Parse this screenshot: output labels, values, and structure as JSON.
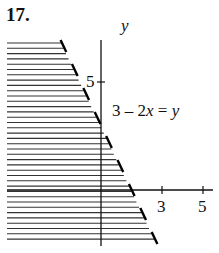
{
  "problem_number": "17.",
  "graph": {
    "y_axis_label": "y",
    "equation": "3 – 2x = y",
    "equation_parts": {
      "a": "3 – 2",
      "x": "x",
      "eq": " = ",
      "y": "y"
    },
    "x_ticks": [
      {
        "value": 3,
        "label": "3"
      },
      {
        "value": 5,
        "label": "5"
      }
    ],
    "y_ticks": [
      {
        "value": 5,
        "label": "5"
      }
    ],
    "boundary": "dashed",
    "shaded_region": "left of line (horizontal hatching)"
  },
  "chart_data": {
    "type": "area",
    "title": "17.",
    "xlabel": "",
    "ylabel": "y",
    "boundary_line": {
      "equation": "y = 3 - 2x",
      "style": "dashed"
    },
    "inequality": "y < 3 - 2x (left side shaded)",
    "x_ticks": [
      3,
      5
    ],
    "y_ticks": [
      5
    ],
    "xlim": [
      -4.5,
      5.4
    ],
    "ylim": [
      -2.6,
      7
    ]
  }
}
